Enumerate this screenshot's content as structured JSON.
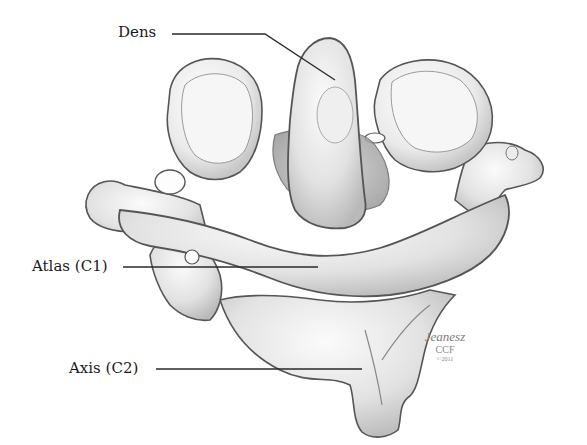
{
  "figure": {
    "background_color": "#ffffff",
    "bone_fill": "#e9e9e9",
    "bone_outline": "#555555",
    "leader_line_color": "#2a2a2a"
  },
  "labels": [
    {
      "id": "dens",
      "text": "Dens"
    },
    {
      "id": "atlas",
      "text": "Atlas (C1)"
    },
    {
      "id": "axis",
      "text": "Axis (C2)"
    }
  ],
  "signature": {
    "artist": "Jeanesz",
    "org": "CCF",
    "year": "©2011"
  }
}
